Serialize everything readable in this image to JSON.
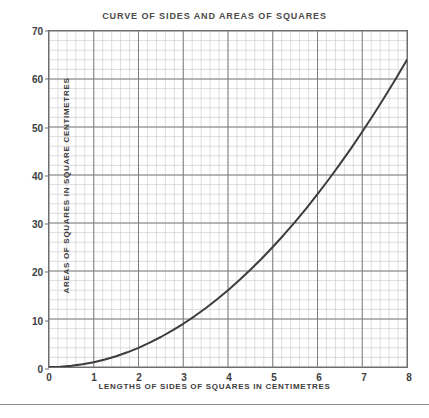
{
  "chart_data": {
    "type": "line",
    "title": "CURVE OF SIDES AND AREAS OF SQUARES",
    "xlabel": "LENGTHS OF SIDES OF SQUARES IN CENTIMETRES",
    "ylabel": "AREAS OF SQUARES IN SQUARE CENTIMETRES",
    "xlim": [
      0,
      8
    ],
    "ylim": [
      0,
      70
    ],
    "x_ticks": [
      0,
      1,
      2,
      3,
      4,
      5,
      6,
      7,
      8
    ],
    "y_ticks": [
      0,
      10,
      20,
      30,
      40,
      50,
      60,
      70
    ],
    "x_minor_per_major": 5,
    "y_minor_per_major": 5,
    "grid": true,
    "legend": "none",
    "series": [
      {
        "name": "area = side squared",
        "x": [
          0,
          0.25,
          0.5,
          0.75,
          1,
          1.25,
          1.5,
          1.75,
          2,
          2.25,
          2.5,
          2.75,
          3,
          3.25,
          3.5,
          3.75,
          4,
          4.25,
          4.5,
          4.75,
          5,
          5.25,
          5.5,
          5.75,
          6,
          6.25,
          6.5,
          6.75,
          7,
          7.25,
          7.5,
          7.75,
          8
        ],
        "y": [
          0,
          0.06,
          0.25,
          0.56,
          1,
          1.56,
          2.25,
          3.06,
          4,
          5.06,
          6.25,
          7.56,
          9,
          10.56,
          12.25,
          14.06,
          16,
          18.06,
          20.25,
          22.56,
          25,
          27.56,
          30.25,
          33.06,
          36,
          39.06,
          42.25,
          45.56,
          49,
          52.56,
          56.25,
          60.06,
          64
        ],
        "color": "#3c3c3c"
      }
    ]
  },
  "style": {
    "minor_grid_color": "#cfcfcf",
    "major_grid_color": "#7d7d7d",
    "border_color": "#6e6e6e",
    "text_color": "#3d3d3d",
    "background": "#ffffff"
  },
  "artifacts": {
    "top_text": "",
    "bottom_text": ""
  }
}
